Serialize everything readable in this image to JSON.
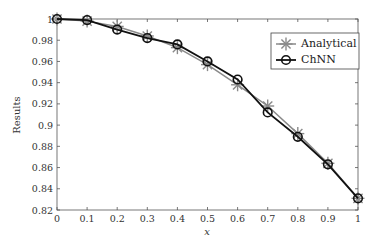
{
  "chart_data": {
    "type": "line",
    "title": "",
    "xlabel": "x",
    "ylabel": "Results",
    "xlim": [
      0,
      1
    ],
    "ylim": [
      0.82,
      1.0
    ],
    "xticks": [
      0,
      0.1,
      0.2,
      0.3,
      0.4,
      0.5,
      0.6,
      0.7,
      0.8,
      0.9,
      1
    ],
    "xtick_labels": [
      "0",
      "0.1",
      "0.2",
      "0.3",
      "0.4",
      "0.5",
      "0.6",
      "0.7",
      "0.8",
      "0.9",
      "1"
    ],
    "yticks": [
      0.82,
      0.84,
      0.86,
      0.88,
      0.9,
      0.92,
      0.94,
      0.96,
      0.98,
      1.0
    ],
    "ytick_labels": [
      "0.82",
      "0.84",
      "0.86",
      "0.88",
      "0.9",
      "0.92",
      "0.94",
      "0.96",
      "0.98",
      "1"
    ],
    "grid": false,
    "legend_position": "upper right",
    "x": [
      0,
      0.1,
      0.2,
      0.3,
      0.4,
      0.5,
      0.6,
      0.7,
      0.8,
      0.9,
      1.0
    ],
    "series": [
      {
        "name": "Analytical",
        "marker": "asterisk",
        "color": "#8a8a8a",
        "values": [
          1.0,
          0.998,
          0.993,
          0.984,
          0.973,
          0.957,
          0.938,
          0.918,
          0.892,
          0.864,
          0.831
        ]
      },
      {
        "name": "ChNN",
        "marker": "circle",
        "color": "#111111",
        "values": [
          1.0,
          0.999,
          0.99,
          0.982,
          0.976,
          0.96,
          0.943,
          0.912,
          0.889,
          0.863,
          0.831
        ]
      }
    ]
  },
  "legend": {
    "items": [
      {
        "label": "Analytical"
      },
      {
        "label": "ChNN"
      }
    ]
  }
}
